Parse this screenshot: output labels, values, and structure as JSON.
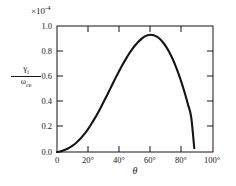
{
  "chart_data": {
    "type": "line",
    "title": "",
    "xlabel": "θ",
    "ylabel": "γᵢ / ω_ce",
    "y_multiplier": "×10",
    "y_multiplier_exponent": "-4",
    "xlim": [
      0,
      100
    ],
    "ylim": [
      0.0,
      1.0
    ],
    "grid": false,
    "legend": "none",
    "xticklabels": [
      "0",
      "20°",
      "40°",
      "60°",
      "80°",
      "100°"
    ],
    "xtickvalues": [
      0,
      20,
      40,
      60,
      80,
      100
    ],
    "yticklabels": [
      "0.0",
      "0.2",
      "0.4",
      "0.6",
      "0.8",
      "1.0"
    ],
    "ytickvalues": [
      0.0,
      0.2,
      0.4,
      0.6,
      0.8,
      1.0
    ],
    "series": [
      {
        "name": "damping-rate",
        "x": [
          0,
          2,
          4,
          6,
          8,
          10,
          12,
          14,
          16,
          18,
          20,
          22,
          24,
          26,
          28,
          30,
          32,
          34,
          36,
          38,
          40,
          42,
          44,
          46,
          48,
          50,
          52,
          54,
          56,
          58,
          60,
          62,
          64,
          66,
          68,
          70,
          72,
          74,
          76,
          78,
          80,
          82,
          84,
          86,
          88
        ],
        "values": [
          0.0,
          0.004,
          0.012,
          0.022,
          0.035,
          0.051,
          0.07,
          0.093,
          0.12,
          0.15,
          0.184,
          0.222,
          0.263,
          0.306,
          0.352,
          0.4,
          0.449,
          0.499,
          0.549,
          0.598,
          0.646,
          0.692,
          0.735,
          0.776,
          0.812,
          0.845,
          0.873,
          0.896,
          0.915,
          0.927,
          0.931,
          0.927,
          0.915,
          0.896,
          0.869,
          0.834,
          0.792,
          0.742,
          0.684,
          0.618,
          0.545,
          0.464,
          0.375,
          0.278,
          0.03
        ]
      }
    ],
    "peak": {
      "x": 56,
      "y": 0.93
    },
    "curve_end": {
      "x": 88,
      "y": 0.03
    },
    "colors": {
      "line": "#141414",
      "axis": "#141414",
      "background": "#ffffff"
    }
  },
  "axis_geometry": {
    "left": 57,
    "right": 213,
    "top": 26,
    "bottom": 152
  }
}
